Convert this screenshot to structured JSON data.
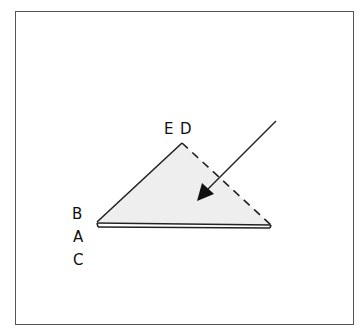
{
  "diagram": {
    "type": "fold-instruction",
    "labels": {
      "top_left": "E",
      "top_right": "D",
      "left_1": "B",
      "left_2": "A",
      "left_3": "C"
    },
    "shape": {
      "kind": "triangle",
      "fill": "#eeeeee",
      "edges": {
        "left": "solid",
        "right": "dashed",
        "base": "double-solid"
      }
    },
    "arrow": {
      "direction": "down-left",
      "meaning": "fold"
    },
    "colors": {
      "line": "#222222",
      "frame": "#555555",
      "fill": "#eeeeee"
    }
  }
}
